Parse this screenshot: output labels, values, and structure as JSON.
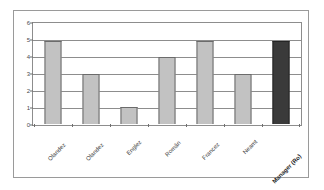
{
  "chart_data": {
    "type": "bar",
    "title": "",
    "xlabel": "",
    "ylabel": "",
    "categories": [
      "Olandez",
      "Olandez",
      "Englez",
      "Român",
      "Francez",
      "Neamt",
      "Manager (Ro)"
    ],
    "values": [
      5,
      3,
      1,
      4,
      5,
      3,
      5
    ],
    "ylim": [
      0,
      6
    ],
    "yticks": [
      "0",
      "1",
      "2",
      "3",
      "4",
      "5",
      "6"
    ],
    "grid": true,
    "legend": "none",
    "bar_colors": [
      "#c2c2c2",
      "#c2c2c2",
      "#c2c2c2",
      "#c2c2c2",
      "#c2c2c2",
      "#c2c2c2",
      "#3a3a3a"
    ],
    "highlight_index": 6,
    "bars": [
      {
        "label": "Olandez",
        "value": 5,
        "highlight": false
      },
      {
        "label": "Olandez",
        "value": 3,
        "highlight": false
      },
      {
        "label": "Englez",
        "value": 1,
        "highlight": false
      },
      {
        "label": "Român",
        "value": 4,
        "highlight": false
      },
      {
        "label": "Francez",
        "value": 5,
        "highlight": false
      },
      {
        "label": "Neamt",
        "value": 3,
        "highlight": false
      },
      {
        "label": "Manager (Ro)",
        "value": 5,
        "highlight": true
      }
    ]
  },
  "colors": {
    "bar_default": "#c2c2c2",
    "bar_highlight": "#3a3a3a",
    "gridline": "#8d8d8d",
    "frame": "#9a9a9a",
    "background": "#ffffff",
    "text": "#3f3f3f"
  }
}
